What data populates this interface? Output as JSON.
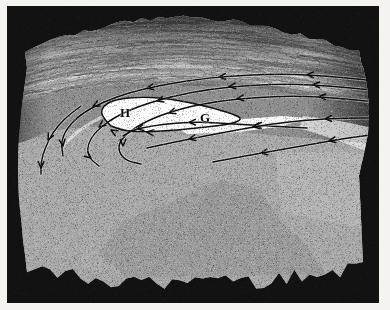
{
  "figure": {
    "kind": "halftone-photographic-plate",
    "frame": {
      "paper_color": "#f4f3f0",
      "plate_color": "#121212",
      "margin_px": 7
    }
  },
  "labels": [
    {
      "id": "H",
      "text": "H",
      "x": 113,
      "y": 100,
      "role": "vortex-eye-label"
    },
    {
      "id": "G",
      "text": "G",
      "x": 193,
      "y": 105,
      "role": "wedge-region-label"
    }
  ],
  "colors": {
    "background_paper": "#f4f3f0",
    "plate_dark": "#121212",
    "cloud_band_light": "#cfcfcf",
    "cloud_band_mid": "#8e8e8e",
    "oval_white": "#fafafa",
    "lower_mass_gray": "#a8a8a8",
    "lower_mass_gray_dark": "#9a9a9a",
    "lower_mass_gray_light": "#b4b4b4",
    "streamline_ink": "#0d0d0d"
  },
  "chart_data": {
    "type": "line",
    "title": "",
    "xlabel": "",
    "ylabel": "",
    "grid": false,
    "legend": "none",
    "annotations": [
      {
        "label": "H",
        "x": 116,
        "y": 107,
        "note": "bright oval eye of the vortex"
      },
      {
        "label": "G",
        "x": 196,
        "y": 112,
        "note": "narrow wedge where streamlines converge"
      }
    ],
    "series": [
      {
        "name": "streamline-1-outer",
        "direction": "leftward",
        "points": [
          [
            360,
            74
          ],
          [
            320,
            70
          ],
          [
            280,
            68
          ],
          [
            240,
            69
          ],
          [
            200,
            72
          ],
          [
            160,
            78
          ],
          [
            124,
            86
          ],
          [
            96,
            96
          ],
          [
            74,
            108
          ],
          [
            60,
            122
          ],
          [
            54,
            136
          ],
          [
            56,
            150
          ]
        ],
        "arrows": [
          [
            300,
            68.6
          ],
          [
            212,
            70.9
          ],
          [
            140,
            82.2
          ],
          [
            86,
            100.5
          ],
          [
            56,
            140
          ]
        ]
      },
      {
        "name": "streamline-2",
        "direction": "leftward",
        "points": [
          [
            364,
            84
          ],
          [
            324,
            80
          ],
          [
            284,
            78
          ],
          [
            244,
            79
          ],
          [
            204,
            83
          ],
          [
            166,
            90
          ],
          [
            132,
            100
          ],
          [
            106,
            112
          ],
          [
            88,
            126
          ],
          [
            80,
            140
          ],
          [
            82,
            152
          ],
          [
            92,
            160
          ]
        ],
        "arrows": [
          [
            306,
            78.5
          ],
          [
            222,
            80.6
          ],
          [
            150,
            95
          ],
          [
            92,
            121
          ],
          [
            84,
            152
          ]
        ]
      },
      {
        "name": "streamline-3",
        "direction": "leftward",
        "points": [
          [
            368,
            96
          ],
          [
            330,
            92
          ],
          [
            292,
            90
          ],
          [
            252,
            91
          ],
          [
            212,
            95
          ],
          [
            176,
            102
          ],
          [
            146,
            112
          ],
          [
            124,
            124
          ],
          [
            112,
            136
          ],
          [
            112,
            147
          ],
          [
            120,
            155
          ],
          [
            134,
            158
          ]
        ],
        "arrows": [
          [
            312,
            90.5
          ],
          [
            230,
            92.6
          ],
          [
            162,
            107
          ],
          [
            116,
            140
          ]
        ]
      },
      {
        "name": "streamline-4-wedge",
        "direction": "leftward",
        "points": [
          [
            300,
            122
          ],
          [
            262,
            120
          ],
          [
            226,
            118
          ],
          [
            196,
            116
          ],
          [
            168,
            117
          ],
          [
            144,
            120
          ],
          [
            126,
            124
          ],
          [
            116,
            130
          ]
        ],
        "arrows": [
          [
            248,
            119
          ],
          [
            182,
            116.4
          ],
          [
            130,
            123
          ]
        ]
      },
      {
        "name": "streamline-5-return",
        "direction": "leftward-descending",
        "points": [
          [
            372,
            112
          ],
          [
            336,
            112
          ],
          [
            300,
            114
          ],
          [
            264,
            118
          ],
          [
            230,
            124
          ],
          [
            198,
            130
          ],
          [
            168,
            136
          ],
          [
            140,
            142
          ]
        ],
        "arrows": [
          [
            318,
            112.8
          ],
          [
            246,
            120.8
          ],
          [
            182,
            133
          ]
        ]
      },
      {
        "name": "streamline-6-lower-return",
        "direction": "descending-left",
        "points": [
          [
            372,
            128
          ],
          [
            340,
            132
          ],
          [
            306,
            138
          ],
          [
            272,
            144
          ],
          [
            238,
            150
          ],
          [
            206,
            156
          ]
        ],
        "arrows": [
          [
            322,
            134.8
          ],
          [
            254,
            147
          ]
        ]
      },
      {
        "name": "streamline-7-left-outflow",
        "direction": "down-left",
        "points": [
          [
            74,
            100
          ],
          [
            58,
            112
          ],
          [
            46,
            126
          ],
          [
            38,
            142
          ],
          [
            34,
            156
          ],
          [
            34,
            168
          ]
        ],
        "arrows": [
          [
            41,
            134
          ],
          [
            34,
            162
          ]
        ]
      }
    ],
    "shapes": [
      {
        "name": "vortex-eye-oval",
        "fill": "#fafafa",
        "outline": "#0d0d0d",
        "path": [
          [
            104,
            120
          ],
          [
            96,
            112
          ],
          [
            94,
            104
          ],
          [
            100,
            97
          ],
          [
            112,
            93
          ],
          [
            132,
            91
          ],
          [
            156,
            92
          ],
          [
            180,
            96
          ],
          [
            206,
            102
          ],
          [
            226,
            108
          ],
          [
            236,
            113
          ],
          [
            224,
            118
          ],
          [
            200,
            121
          ],
          [
            170,
            124
          ],
          [
            140,
            126
          ],
          [
            118,
            125
          ]
        ]
      },
      {
        "name": "lower-gray-mass",
        "fill": "#a8a8a8",
        "note": "50% halftone dithered mass filling lower half with ragged bottom edge"
      }
    ]
  }
}
